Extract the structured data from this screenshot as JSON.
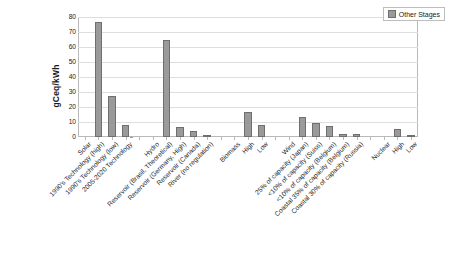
{
  "chart_data": {
    "type": "bar",
    "title": "",
    "xlabel": "",
    "ylabel": "gCeq/kWh",
    "ylim": [
      0,
      80
    ],
    "yticks": [
      0,
      10,
      20,
      30,
      40,
      50,
      60,
      70,
      80
    ],
    "grid": true,
    "legend_position": "top-right",
    "legend": [
      "Other Stages"
    ],
    "categories": [
      "Solar",
      "1990's Technology (high)",
      "1990's Technology (low)",
      "2005-2020 Technology",
      "",
      "Hydro",
      "Reservoir (Brasil, Theoretical)",
      "Reservoir (Germany, High)",
      "Reservoir (Canada)",
      "River (no regulation)",
      "",
      "Biomass",
      "High",
      "Low",
      "",
      "Wind",
      "25% of capacity (Japan)",
      "<10% of capacity (Suiss)",
      "<10% of capacity (Belgium)",
      "Coastal 35% of capacity (Belgium)",
      "Coastal 30% of capacity (Russia)",
      "",
      "Nuclear",
      "High",
      "Low"
    ],
    "series": [
      {
        "name": "Other Stages",
        "values": [
          null,
          76.5,
          27.5,
          8.0,
          null,
          null,
          64.5,
          6.5,
          4.2,
          0.8,
          null,
          null,
          16.5,
          8.2,
          null,
          null,
          13.2,
          9.5,
          7.6,
          2.2,
          2.2,
          null,
          null,
          5.2,
          0.6
        ]
      }
    ]
  },
  "legend": {
    "entry_0": "Other Stages"
  },
  "axis": {
    "y_title": "gCeq/kWh",
    "ticks": [
      "80",
      "70",
      "60",
      "50",
      "40",
      "30",
      "20",
      "10",
      "0"
    ]
  }
}
